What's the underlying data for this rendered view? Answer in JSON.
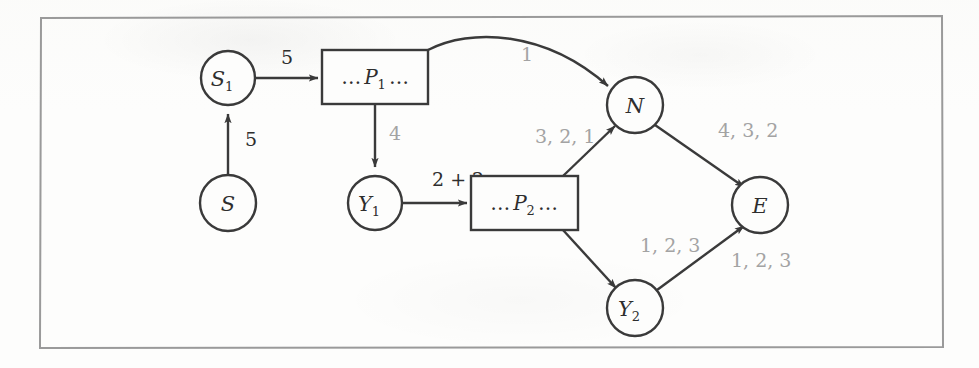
{
  "figure": {
    "kind": "directed-graph-diagram",
    "frame": {
      "stroke": "#9a9a9a"
    },
    "colors": {
      "node_stroke": "#3a3a3a",
      "edge_stroke": "#3a3a3a",
      "dark_label": "#2e2e2e",
      "grey_label": "#a3a3a3",
      "background": "#fdfdfc"
    },
    "nodes": [
      {
        "id": "S",
        "label": "S",
        "shape": "circle",
        "cx": 228,
        "cy": 203,
        "r": 28
      },
      {
        "id": "S1",
        "label": "S",
        "sub": "1",
        "shape": "circle",
        "cx": 228,
        "cy": 78,
        "r": 27
      },
      {
        "id": "Y1",
        "label": "Y",
        "sub": "1",
        "shape": "circle",
        "cx": 375,
        "cy": 203,
        "r": 27
      },
      {
        "id": "N",
        "label": "N",
        "shape": "circle",
        "cx": 635,
        "cy": 105,
        "r": 28
      },
      {
        "id": "Y2",
        "label": "Y",
        "sub": "2",
        "shape": "circle",
        "cx": 635,
        "cy": 308,
        "r": 28
      },
      {
        "id": "E",
        "label": "E",
        "shape": "circle",
        "cx": 760,
        "cy": 205,
        "r": 28
      }
    ],
    "boxes": [
      {
        "id": "P1",
        "prefix": "…",
        "label": "P",
        "sub": "1",
        "suffix": "…",
        "x": 322,
        "y": 50,
        "w": 106,
        "h": 54
      },
      {
        "id": "P2",
        "prefix": "…",
        "label": "P",
        "sub": "2",
        "suffix": "…",
        "x": 471,
        "y": 176,
        "w": 107,
        "h": 54
      }
    ],
    "edges": [
      {
        "id": "S-to-S1",
        "from": "S",
        "to": "S1",
        "label": "5",
        "label_style": "dark",
        "label_x": 245,
        "label_y": 146
      },
      {
        "id": "S1-to-P1",
        "from": "S1",
        "to": "P1",
        "label": "5",
        "label_style": "dark",
        "label_x": 281,
        "label_y": 64
      },
      {
        "id": "P1-to-N",
        "from": "P1",
        "to": "N",
        "label": "1",
        "label_style": "grey",
        "label_x": 521,
        "label_y": 61
      },
      {
        "id": "P1-to-Y1",
        "from": "P1",
        "to": "Y1",
        "label": "4",
        "label_style": "grey",
        "label_x": 389,
        "label_y": 140
      },
      {
        "id": "Y1-to-P2",
        "from": "Y1",
        "to": "P2",
        "label": "2 + 2",
        "label_style": "dark",
        "label_x": 432,
        "label_y": 186
      },
      {
        "id": "P2-to-N",
        "from": "P2",
        "to": "N",
        "label": "3, 2, 1",
        "label_style": "grey",
        "label_x": 535,
        "label_y": 143
      },
      {
        "id": "N-to-E",
        "from": "N",
        "to": "E",
        "label": "4, 3, 2",
        "label_style": "grey",
        "label_x": 718,
        "label_y": 137
      },
      {
        "id": "P2-to-Y2",
        "from": "P2",
        "to": "Y2",
        "label": "1, 2, 3",
        "label_style": "grey",
        "label_x": 640,
        "label_y": 252
      },
      {
        "id": "Y2-to-E",
        "from": "Y2",
        "to": "E",
        "label": "1, 2, 3",
        "label_style": "grey",
        "label_x": 731,
        "label_y": 267
      }
    ]
  }
}
